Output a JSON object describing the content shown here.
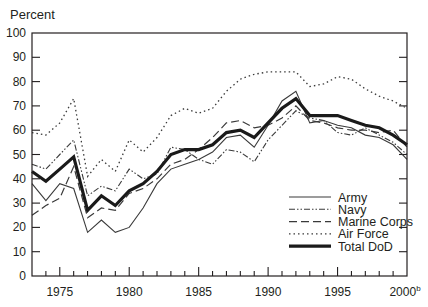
{
  "chart_data": {
    "type": "line",
    "title": "",
    "ylabel": "Percent",
    "xlabel": "",
    "ylim": [
      0,
      100
    ],
    "xlim": [
      1973,
      2000
    ],
    "yticks": [
      0,
      10,
      20,
      30,
      40,
      50,
      60,
      70,
      80,
      90,
      100
    ],
    "xticks": [
      1975,
      1980,
      1985,
      1990,
      1995,
      2000
    ],
    "xtick_labels": [
      "1975",
      "1980",
      "1985",
      "1990",
      "1995",
      "2000"
    ],
    "last_xtick_superscript": "b",
    "grid": false,
    "legend_position": "lower-right inside",
    "x": [
      1973,
      1974,
      1975,
      1976,
      1977,
      1978,
      1979,
      1980,
      1981,
      1982,
      1983,
      1984,
      1985,
      1986,
      1987,
      1988,
      1989,
      1990,
      1991,
      1992,
      1993,
      1994,
      1995,
      1996,
      1997,
      1998,
      1999,
      2000
    ],
    "series": [
      {
        "name": "Army",
        "style": "solid-thin",
        "values": [
          38,
          31,
          38,
          36,
          18,
          23,
          18,
          20,
          28,
          38,
          44,
          46,
          48,
          51,
          57,
          58,
          53,
          62,
          72,
          76,
          63,
          64,
          62,
          61,
          58,
          57,
          54,
          48
        ]
      },
      {
        "name": "Navy",
        "style": "dash-dot-dot",
        "values": [
          46,
          44,
          50,
          56,
          33,
          37,
          35,
          44,
          40,
          42,
          53,
          52,
          48,
          46,
          52,
          51,
          47,
          56,
          62,
          68,
          65,
          64,
          59,
          58,
          61,
          58,
          55,
          50
        ]
      },
      {
        "name": "Marine Corps",
        "style": "long-dash",
        "values": [
          25,
          29,
          32,
          45,
          24,
          28,
          27,
          34,
          36,
          40,
          46,
          48,
          52,
          57,
          63,
          64,
          61,
          62,
          65,
          70,
          64,
          63,
          61,
          60,
          60,
          59,
          60,
          53
        ]
      },
      {
        "name": "Air Force",
        "style": "dotted",
        "values": [
          59,
          58,
          63,
          73,
          41,
          48,
          43,
          56,
          51,
          57,
          66,
          69,
          67,
          69,
          76,
          81,
          83,
          84,
          84,
          84,
          78,
          79,
          82,
          81,
          77,
          74,
          72,
          69
        ]
      },
      {
        "name": "Total DoD",
        "style": "solid-thick",
        "values": [
          43,
          39,
          44,
          49,
          27,
          33,
          29,
          35,
          38,
          43,
          50,
          52,
          52,
          54,
          59,
          60,
          57,
          63,
          69,
          73,
          66,
          66,
          66,
          64,
          62,
          61,
          58,
          54
        ]
      }
    ]
  },
  "colors": {
    "ink": "#231f20",
    "series": "#3a3a3a",
    "total": "#1a1a1a"
  }
}
